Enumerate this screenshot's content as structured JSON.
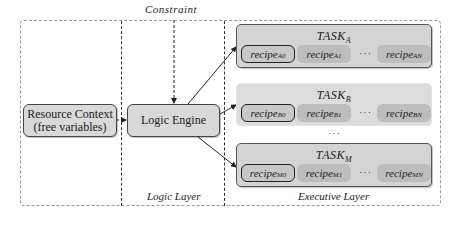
{
  "constraint_label": "Constraint",
  "layers": {
    "logic": "Logic Layer",
    "executive": "Executive Layer"
  },
  "nodes": {
    "resource_context": {
      "line1": "Resource Context",
      "line2": "(free variables)"
    },
    "logic_engine": {
      "label": "Logic Engine"
    }
  },
  "tasks": [
    {
      "base": "TASK",
      "sub": "A",
      "recipes": [
        {
          "base": "recipe",
          "sub": "A",
          "idx": "0"
        },
        {
          "base": "recipe",
          "sub": "A",
          "idx": "1"
        },
        {
          "base": "recipe",
          "sub": "A",
          "idx": "N"
        }
      ],
      "ellipsis": "···"
    },
    {
      "base": "TASK",
      "sub": "B",
      "recipes": [
        {
          "base": "recipe",
          "sub": "B",
          "idx": "0"
        },
        {
          "base": "recipe",
          "sub": "B",
          "idx": "1"
        },
        {
          "base": "recipe",
          "sub": "B",
          "idx": "N"
        }
      ],
      "ellipsis": "···"
    },
    {
      "base": "TASK",
      "sub": "M",
      "recipes": [
        {
          "base": "recipe",
          "sub": "M",
          "idx": "0"
        },
        {
          "base": "recipe",
          "sub": "M",
          "idx": "1"
        },
        {
          "base": "recipe",
          "sub": "M",
          "idx": "N"
        }
      ],
      "ellipsis": "···"
    }
  ],
  "between_tasks_ellipsis": "···",
  "colors": {
    "box_fill": "#d9d9d9",
    "recipe_fill": "#bdbdbd",
    "border": "#444444",
    "dashed": "#9a9a9a"
  }
}
